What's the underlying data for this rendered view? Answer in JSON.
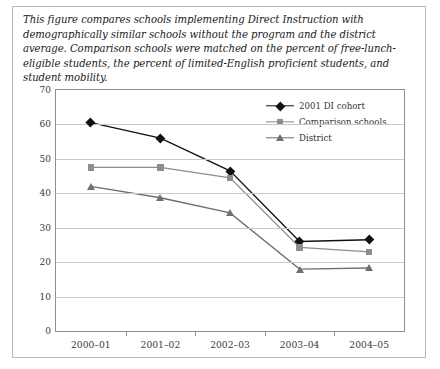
{
  "caption": "This figure compares schools implementing Direct Instruction with demographically similar schools without the program and the district average. Comparison schools were matched on the percent of free-lunch-eligible students, the percent of limited-English proficient students, and student mobility.",
  "chart_data": {
    "type": "line",
    "title": "",
    "xlabel": "",
    "ylabel": "",
    "categories": [
      "2000–01",
      "2001–02",
      "2002–03",
      "2003–04",
      "2004–05"
    ],
    "series": [
      {
        "name": "2001 DI cohort",
        "values": [
          60.5,
          56.0,
          46.5,
          26.0,
          26.5
        ],
        "color": "#111111",
        "marker": "diamond"
      },
      {
        "name": "Comparison schools",
        "values": [
          47.5,
          47.5,
          44.5,
          24.3,
          23.0
        ],
        "color": "#8d8d8d",
        "marker": "square"
      },
      {
        "name": "District",
        "values": [
          42.0,
          38.7,
          34.3,
          18.0,
          18.3
        ],
        "color": "#6f6f6f",
        "marker": "triangle"
      }
    ],
    "ylim": [
      0,
      70
    ],
    "yticks": [
      0,
      10,
      20,
      30,
      40,
      50,
      60,
      70
    ],
    "ytick_labels": [
      "0",
      "10",
      "20",
      "30",
      "40",
      "50",
      "60",
      "70"
    ],
    "grid": true,
    "grid_axis": "y",
    "legend_position": "upper-right-inside"
  }
}
